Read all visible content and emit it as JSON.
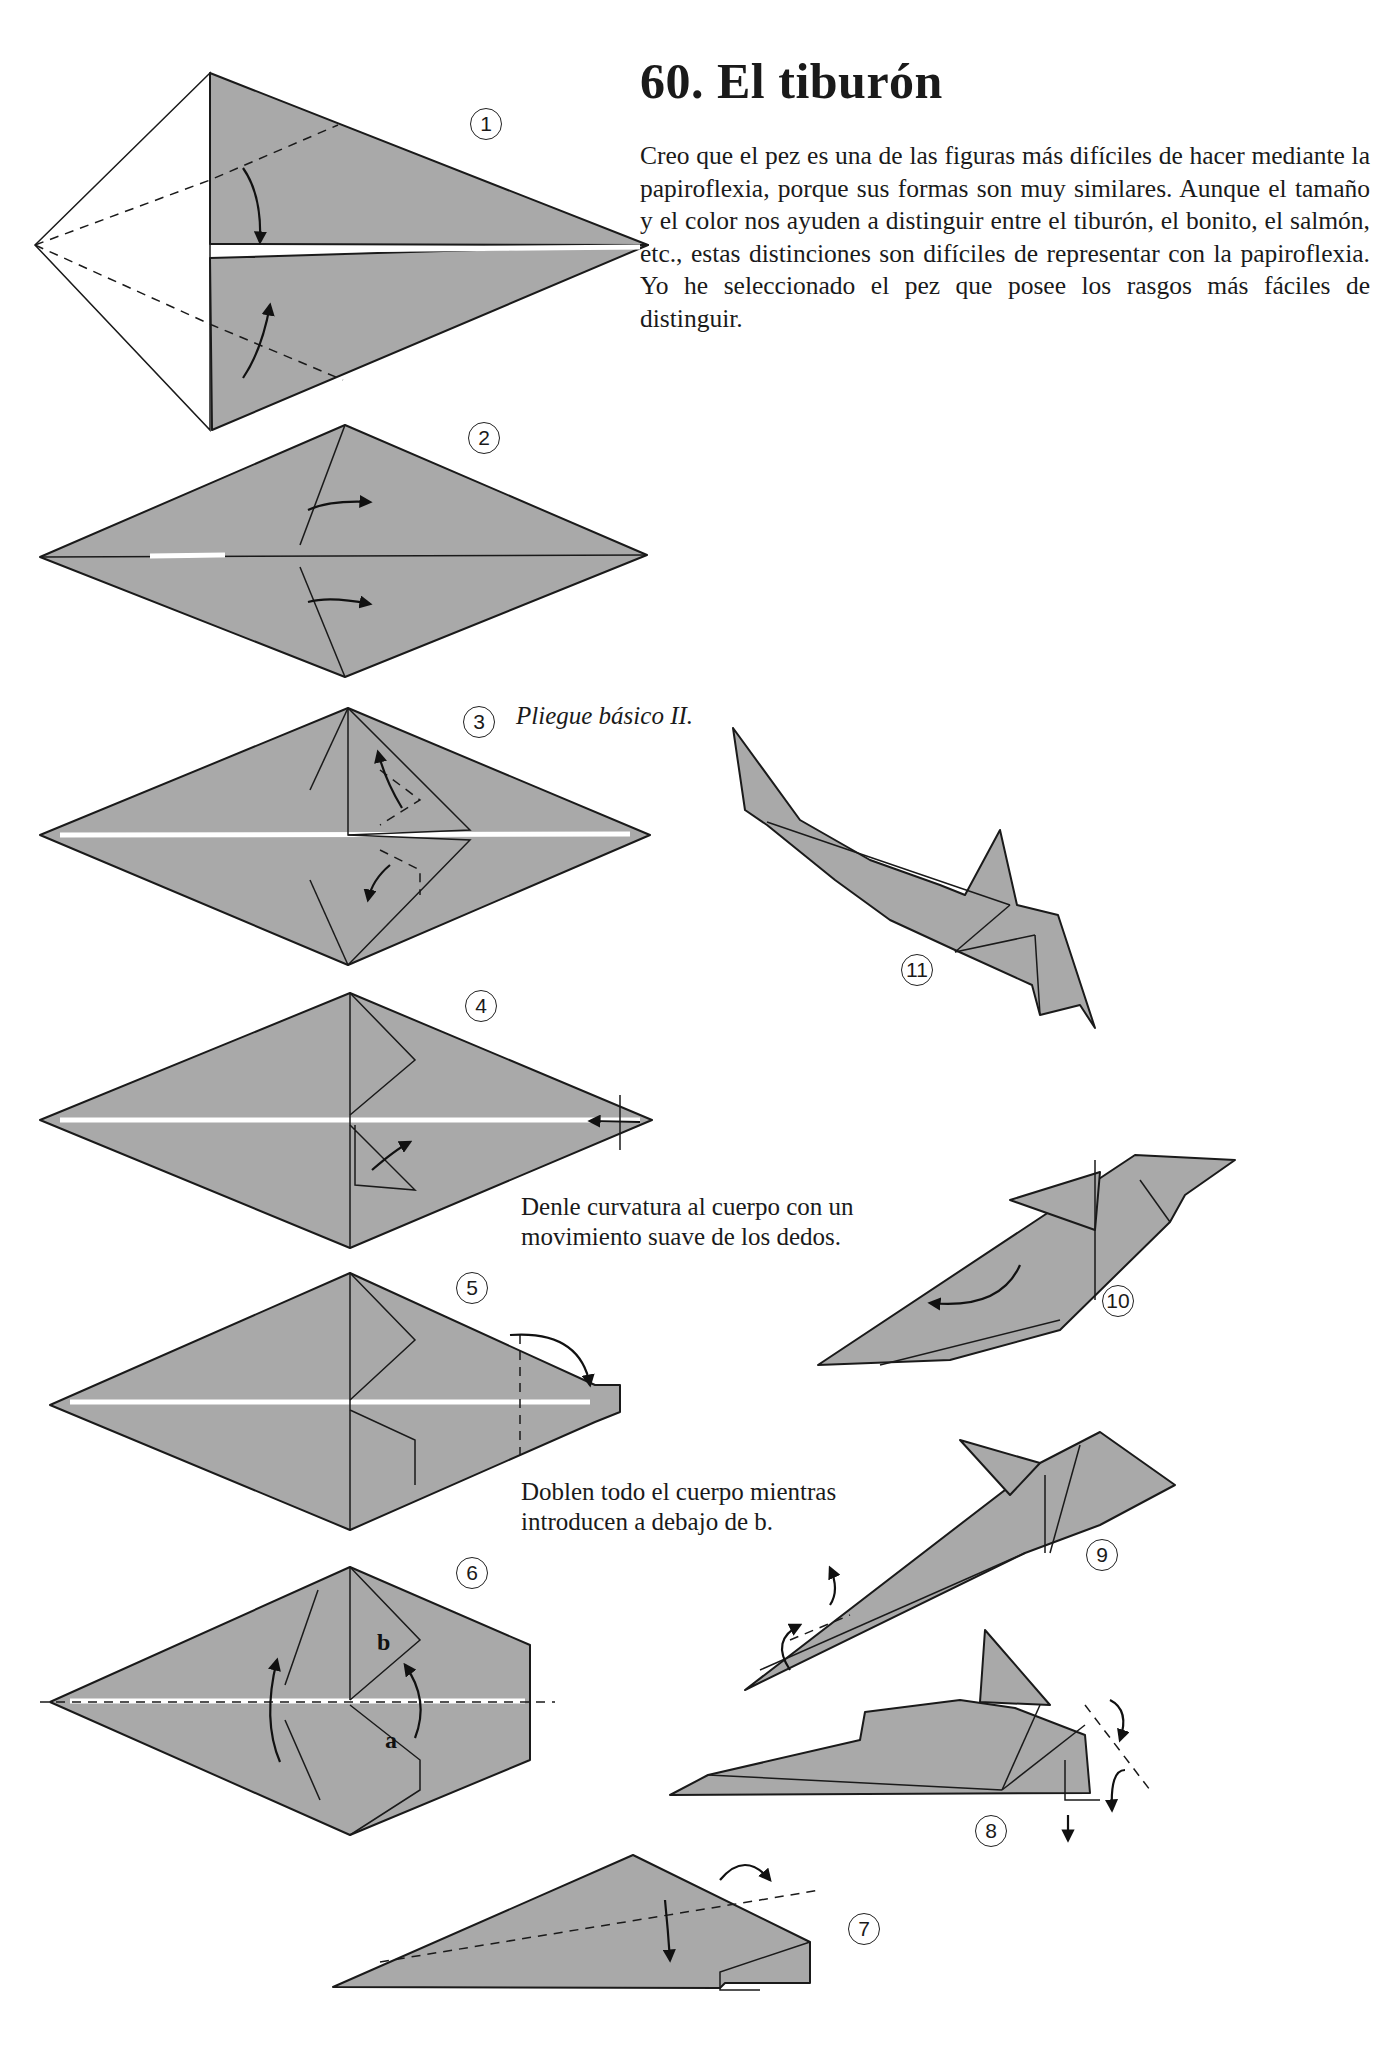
{
  "page": {
    "title": "60.  El tiburón",
    "intro": "Creo que el pez es una de las figuras más difíciles de hacer mediante la papiroflexia, porque sus formas son muy similares. Aunque el tamaño y el color nos ayuden a distinguir entre el tiburón, el bonito, el salmón, etc., estas distinciones son difíciles de representar con la papiroflexia. Yo he seleccionado el pez que posee los rasgos más fáciles de distinguir."
  },
  "steps": [
    {
      "num": "1"
    },
    {
      "num": "2"
    },
    {
      "num": "3",
      "caption": "Pliegue básico II."
    },
    {
      "num": "4"
    },
    {
      "num": "5"
    },
    {
      "num": "6",
      "labels": [
        "b",
        "a"
      ]
    },
    {
      "num": "7"
    },
    {
      "num": "8"
    },
    {
      "num": "9"
    },
    {
      "num": "10"
    },
    {
      "num": "11"
    }
  ],
  "notes": {
    "curve": "Denle curvatura al cuerpo con un movimiento suave de los dedos.",
    "fold": "Doblen todo el cuerpo mientras introducen a debajo de b."
  },
  "colors": {
    "paper": "#a9a9a9",
    "line": "#1a1a1a",
    "background": "#ffffff"
  }
}
